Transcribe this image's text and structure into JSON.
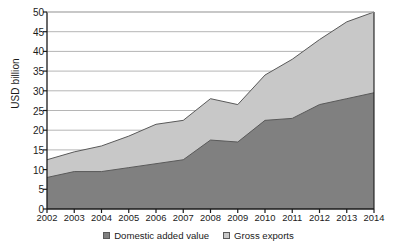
{
  "chart_data": {
    "type": "area",
    "stacked": true,
    "title": "",
    "xlabel": "",
    "ylabel": "USD billion",
    "categories": [
      "2002",
      "2003",
      "2004",
      "2005",
      "2006",
      "2007",
      "2008",
      "2009",
      "2010",
      "2011",
      "2012",
      "2013",
      "2014"
    ],
    "ylim": [
      0,
      50
    ],
    "ytick_values": [
      0,
      5,
      10,
      15,
      20,
      25,
      30,
      35,
      40,
      45,
      50
    ],
    "ytick_labels": [
      "0",
      "5",
      "10",
      "15",
      "20",
      "25",
      "30",
      "35",
      "40",
      "45",
      "50"
    ],
    "grid": true,
    "grid_axis": "y",
    "legend_position": "bottom",
    "series": [
      {
        "name": "Domestic added value",
        "color": "#808080",
        "values": [
          8,
          9.5,
          9.5,
          10.5,
          11.5,
          12.5,
          17.5,
          17,
          22.5,
          23,
          26.5,
          28,
          29.5
        ]
      },
      {
        "name": "Gross exports",
        "color": "#c8c8c8",
        "values": [
          12.5,
          14.5,
          16,
          18.5,
          21.5,
          22.5,
          28,
          26.5,
          34,
          38,
          43,
          47.5,
          50
        ]
      }
    ],
    "colors": {
      "domestic_added_value": "#808080",
      "gross_exports": "#c8c8c8",
      "axis": "#1a1a1a",
      "gridline": "#b5b5b5",
      "series_outline": "#5a5a5a"
    }
  },
  "legend": {
    "items": [
      {
        "label": "Domestic added value",
        "color": "#808080"
      },
      {
        "label": "Gross exports",
        "color": "#c8c8c8"
      }
    ]
  }
}
